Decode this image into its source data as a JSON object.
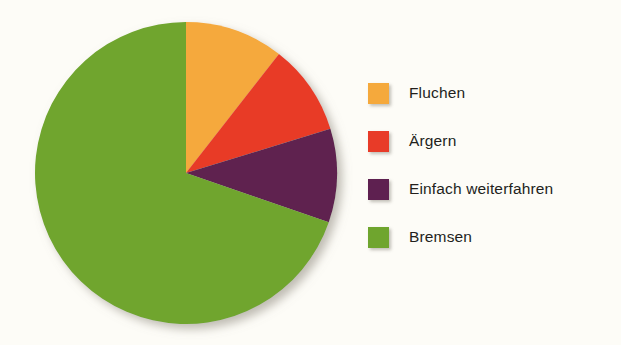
{
  "canvas": {
    "width": 621,
    "height": 345,
    "background": "#fdfcf7"
  },
  "chart_data": {
    "type": "pie",
    "title": "",
    "subtitle": "",
    "xlabel": "",
    "ylabel": "",
    "legend_position": "right",
    "grid": false,
    "start_angle_deg": 0,
    "direction": "clockwise",
    "center": {
      "x": 186,
      "y": 173
    },
    "radius": 151,
    "categories": [
      "Fluchen",
      "Ärgern",
      "Einfach weiterfahren",
      "Bremsen"
    ],
    "values": [
      10.6,
      9.7,
      10.0,
      69.7
    ],
    "colors": [
      "#f5a93c",
      "#e83b28",
      "#5e2050",
      "#6fa52e"
    ],
    "slices": [
      {
        "label": "Fluchen",
        "value": 10.6,
        "color": "#f5a93c",
        "start_angle_deg": 0,
        "end_angle_deg": 38
      },
      {
        "label": "Ärgern",
        "value": 9.7,
        "color": "#e83b28",
        "start_angle_deg": 38,
        "end_angle_deg": 73
      },
      {
        "label": "Einfach weiterfahren",
        "value": 10.0,
        "color": "#5e2050",
        "start_angle_deg": 73,
        "end_angle_deg": 109
      },
      {
        "label": "Bremsen",
        "value": 69.7,
        "color": "#6fa52e",
        "start_angle_deg": 109,
        "end_angle_deg": 360
      }
    ]
  },
  "legend": {
    "items": [
      {
        "label": "Fluchen",
        "color": "#f5a93c"
      },
      {
        "label": "Ärgern",
        "color": "#e83b28"
      },
      {
        "label": "Einfach weiterfahren",
        "color": "#5e2050"
      },
      {
        "label": "Bremsen",
        "color": "#6fa52e"
      }
    ]
  }
}
